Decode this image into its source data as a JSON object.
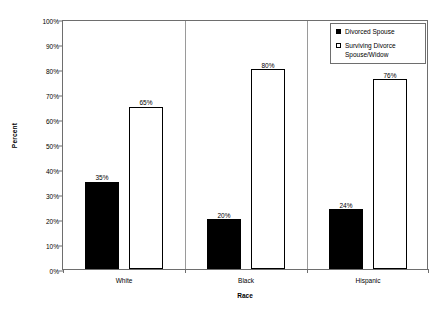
{
  "chart_data": {
    "type": "bar",
    "title": "",
    "xlabel": "Race",
    "ylabel": "Percent",
    "categories": [
      "White",
      "Black",
      "Hispanic"
    ],
    "series": [
      {
        "name": "Divorced Spouse",
        "values": [
          35,
          20,
          24
        ]
      },
      {
        "name": "Surviving Divorce Spouse/Widow",
        "values": [
          65,
          80,
          76
        ]
      }
    ],
    "data_labels": [
      [
        "35%",
        "20%",
        "24%"
      ],
      [
        "65%",
        "80%",
        "76%"
      ]
    ],
    "ylim": [
      0,
      100
    ],
    "ytick_values": [
      0,
      10,
      20,
      30,
      40,
      50,
      60,
      70,
      80,
      90,
      100
    ],
    "ytick_labels": [
      "0%",
      "10%",
      "20%",
      "30%",
      "40%",
      "50%",
      "60%",
      "70%",
      "80%",
      "90%",
      "100%"
    ],
    "grid": false,
    "legend_position": "top-right",
    "colors": {
      "series_0_fill": "#000000",
      "series_0_border": "#000000",
      "series_1_fill": "#ffffff",
      "series_1_border": "#000000",
      "axis": "#6e6e6e",
      "separator": "#9a9a9a",
      "background": "#ffffff",
      "text": "#000000"
    }
  },
  "legend": {
    "entries": [
      {
        "label": "Divorced Spouse",
        "swatch": "filled-black-square-icon"
      },
      {
        "label": "Surviving Divorce Spouse/Widow",
        "swatch": "outlined-white-square-icon"
      }
    ]
  }
}
